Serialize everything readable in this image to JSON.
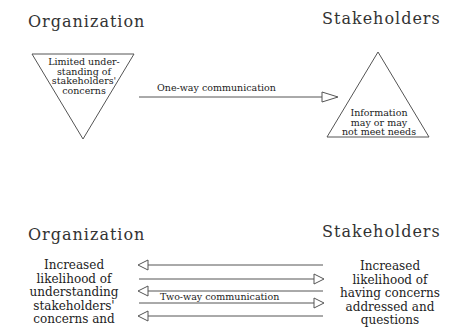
{
  "top_panel": {
    "organization_heading": "Organization",
    "stakeholders_heading": "Stakeholders",
    "organization_triangle_text": [
      "Limited under-",
      "standing of",
      "stakeholders'",
      "concerns"
    ],
    "stakeholders_triangle_text": [
      "Information",
      "may or may",
      "not meet needs"
    ],
    "communication_label": "One-way communication",
    "arrow_direction": "organization-to-stakeholders"
  },
  "bottom_panel": {
    "organization_heading": "Organization",
    "stakeholders_heading": "Stakeholders",
    "organization_text": [
      "Increased",
      "likelihood of",
      "understanding",
      "stakeholders'",
      "concerns and"
    ],
    "stakeholders_text": [
      "Increased",
      "likelihood of",
      "having concerns",
      "addressed and",
      "questions"
    ],
    "communication_label": "Two-way communication",
    "arrows": [
      {
        "direction": "left"
      },
      {
        "direction": "right"
      },
      {
        "direction": "left"
      },
      {
        "direction": "right"
      },
      {
        "direction": "left"
      }
    ]
  },
  "colors": {
    "line": "#555555",
    "text": "#222222",
    "background": "#ffffff"
  }
}
